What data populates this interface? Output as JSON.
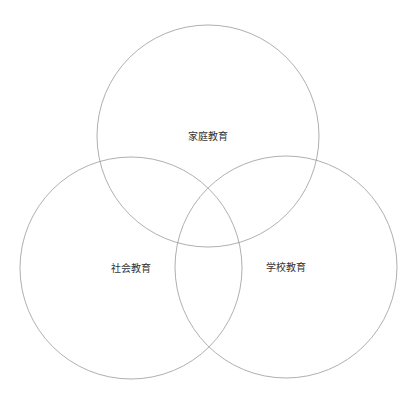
{
  "diagram": {
    "type": "venn",
    "stroke_color": "#9a9a9a",
    "text_color": "#333333",
    "circles": [
      {
        "id": "family",
        "label": "家庭教育",
        "cx": 208,
        "cy": 136,
        "r": 111
      },
      {
        "id": "society",
        "label": "社会教育",
        "cx": 131,
        "cy": 268,
        "r": 111
      },
      {
        "id": "school",
        "label": "学校教育",
        "cx": 286,
        "cy": 267,
        "r": 111
      }
    ]
  }
}
